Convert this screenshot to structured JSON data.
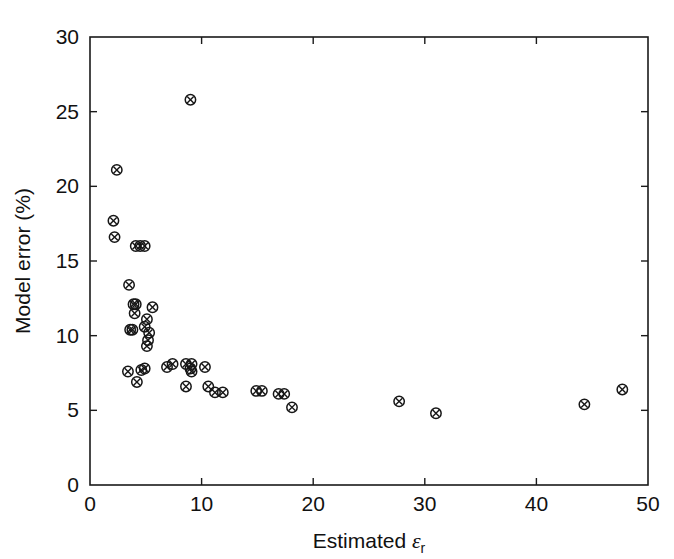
{
  "chart_data": {
    "type": "scatter",
    "title": "",
    "xlabel": "Estimated εr",
    "xlabel_parts": {
      "text": "Estimated ",
      "symbol": "ε",
      "subscript": "r"
    },
    "ylabel": "Model error (%)",
    "xlim": [
      0,
      50
    ],
    "ylim": [
      0,
      30
    ],
    "xticks": [
      0,
      10,
      20,
      30,
      40,
      50
    ],
    "yticks": [
      0,
      5,
      10,
      15,
      20,
      25,
      30
    ],
    "xtick_labels": [
      "0",
      "10",
      "20",
      "30",
      "40",
      "50"
    ],
    "ytick_labels": [
      "0",
      "5",
      "10",
      "15",
      "20",
      "25",
      "30"
    ],
    "grid": false,
    "legend": null,
    "marker": "circle-with-cross",
    "marker_color": "#161616",
    "series": [
      {
        "name": "Model error vs estimated relative permittivity",
        "points": [
          [
            2.4,
            21.1
          ],
          [
            2.1,
            17.7
          ],
          [
            2.2,
            16.6
          ],
          [
            4.1,
            16.0
          ],
          [
            4.5,
            16.0
          ],
          [
            4.9,
            16.0
          ],
          [
            3.5,
            13.4
          ],
          [
            3.9,
            12.1
          ],
          [
            4.1,
            12.1
          ],
          [
            5.6,
            11.9
          ],
          [
            4.0,
            11.5
          ],
          [
            5.1,
            11.1
          ],
          [
            4.9,
            10.6
          ],
          [
            3.6,
            10.4
          ],
          [
            3.8,
            10.4
          ],
          [
            5.3,
            10.2
          ],
          [
            5.2,
            9.7
          ],
          [
            5.1,
            9.3
          ],
          [
            3.4,
            7.6
          ],
          [
            4.6,
            7.7
          ],
          [
            4.9,
            7.8
          ],
          [
            6.9,
            7.9
          ],
          [
            7.4,
            8.1
          ],
          [
            8.6,
            8.1
          ],
          [
            9.1,
            8.1
          ],
          [
            9.0,
            7.8
          ],
          [
            9.1,
            7.6
          ],
          [
            10.3,
            7.9
          ],
          [
            4.2,
            6.9
          ],
          [
            8.6,
            6.6
          ],
          [
            10.6,
            6.6
          ],
          [
            11.2,
            6.2
          ],
          [
            11.9,
            6.2
          ],
          [
            9.0,
            25.8
          ],
          [
            14.9,
            6.3
          ],
          [
            15.4,
            6.3
          ],
          [
            16.9,
            6.1
          ],
          [
            17.4,
            6.1
          ],
          [
            18.1,
            5.2
          ],
          [
            27.7,
            5.6
          ],
          [
            31.0,
            4.8
          ],
          [
            44.3,
            5.4
          ],
          [
            47.7,
            6.4
          ]
        ]
      }
    ]
  },
  "figure": {
    "plot_area": {
      "left": 90,
      "top": 37,
      "right": 648,
      "bottom": 485
    }
  }
}
